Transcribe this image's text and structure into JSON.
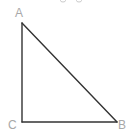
{
  "diagram": {
    "type": "right-triangle",
    "vertices": [
      {
        "id": "A",
        "label": "A",
        "x": 22,
        "y": 23
      },
      {
        "id": "B",
        "label": "B",
        "x": 117,
        "y": 122
      },
      {
        "id": "C",
        "label": "C",
        "x": 22,
        "y": 122
      }
    ],
    "edges": [
      {
        "from": "A",
        "to": "C"
      },
      {
        "from": "C",
        "to": "B"
      },
      {
        "from": "A",
        "to": "B"
      }
    ],
    "right_angle_at": "C",
    "colors": {
      "edge": "#333333",
      "label": "#a8a8a8",
      "background": "#ffffff"
    }
  }
}
